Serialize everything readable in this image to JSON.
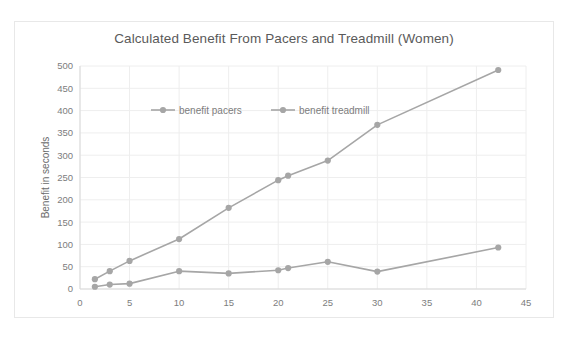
{
  "chart_data": {
    "type": "line",
    "title": "Calculated Benefit From Pacers and Treadmill (Women)",
    "xlabel": "Distance in km",
    "ylabel": "Benefit in seconds",
    "xlim": [
      0,
      45
    ],
    "ylim": [
      0,
      500
    ],
    "xticks": [
      0,
      5,
      10,
      15,
      20,
      25,
      30,
      35,
      40,
      45
    ],
    "yticks": [
      0,
      50,
      100,
      150,
      200,
      250,
      300,
      350,
      400,
      450,
      500
    ],
    "grid": true,
    "legend_position": "top-inside",
    "series": [
      {
        "name": "benefit pacers",
        "color": "#a6a6a6",
        "x": [
          1.5,
          3,
          5,
          10,
          15,
          20,
          21,
          25,
          30,
          42.2
        ],
        "values": [
          5,
          10,
          12,
          40,
          35,
          42,
          47,
          61,
          39,
          93
        ]
      },
      {
        "name": "benefit treadmill",
        "color": "#a6a6a6",
        "x": [
          1.5,
          3,
          5,
          10,
          15,
          20,
          21,
          25,
          30,
          42.2
        ],
        "values": [
          22,
          40,
          63,
          112,
          182,
          244,
          254,
          288,
          368,
          491
        ]
      }
    ]
  },
  "legend": {
    "entries": [
      {
        "label": "benefit pacers"
      },
      {
        "label": "benefit treadmill"
      }
    ]
  },
  "colors": {
    "series": "#a6a6a6",
    "grid": "#eeeeee",
    "axis": "#d9d9d9",
    "text": "#7d7d7d",
    "title": "#5a5a5a",
    "card_border": "#e8e8e8",
    "background": "#ffffff"
  }
}
